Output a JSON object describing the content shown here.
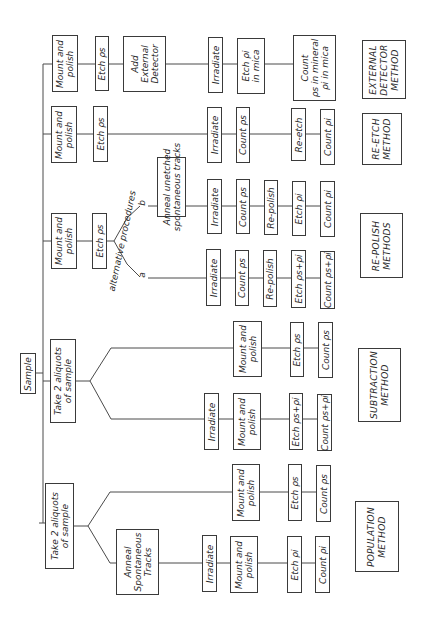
{
  "root": {
    "label": "Sample"
  },
  "branches": {
    "external_detector": {
      "method_label": "EXTERNAL\nDETECTOR\nMETHOD",
      "steps": [
        "Mount and\npolish",
        "Etch ρs",
        "Add\nExternal\nDetector",
        "Irradiate",
        "Etch ρi\nin mica",
        "Count\nρs in mineral\nρi in mica"
      ]
    },
    "re_etch": {
      "method_label": "RE-ETCH\nMETHOD",
      "steps": [
        "Mount and\npolish",
        "Etch ρs",
        "Irradiate",
        "Count ρs",
        "Re-etch",
        "Count ρi"
      ]
    },
    "re_polish": {
      "method_label": "RE-POLISH\nMETHODS",
      "steps": [
        "Mount and\npolish",
        "Etch ρs"
      ],
      "split_label": "alternative procedures",
      "path_b": {
        "marker": "b",
        "steps": [
          "Anneal unetched\nspontaneous tracks",
          "Irradiate",
          "Count ρs",
          "Re-polish",
          "Etch ρi",
          "Count ρi"
        ]
      },
      "path_a": {
        "marker": "a",
        "steps": [
          "Irradiate",
          "Count ρs",
          "Re-polish",
          "Etch ρs+ρi",
          "Count ρs+ρi"
        ]
      }
    },
    "subtraction": {
      "method_label": "SUBTRACTION\nMETHOD",
      "steps": [
        "Take 2 aliquots\nof sample"
      ],
      "upper": {
        "steps": [
          "Mount and\npolish",
          "Etch ρs",
          "Count ρs"
        ]
      },
      "lower": {
        "steps": [
          "Irradiate",
          "Mount and\npolish",
          "Etch ρs+ρi",
          "Count ρs+ρi"
        ]
      }
    },
    "population": {
      "method_label": "POPULATION\nMETHOD",
      "steps": [
        "Take 2 aliquots\nof sample"
      ],
      "upper": {
        "steps": [
          "Mount and\npolish",
          "Etch ρs",
          "Count ρs"
        ]
      },
      "lower": {
        "steps": [
          "Anneal\nSpontaneous\nTracks",
          "Irradiate",
          "Mount and\npolish",
          "Etch ρi",
          "Count ρi"
        ]
      }
    }
  }
}
